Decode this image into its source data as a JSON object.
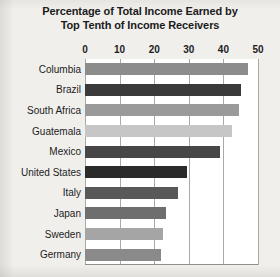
{
  "chart_data": {
    "type": "bar",
    "orientation": "horizontal",
    "title": "Percentage of Total Income Earned by Top Tenth of Income Receivers",
    "title_line1": "Percentage of Total Income Earned by",
    "title_line2": "Top Tenth of Income Receivers",
    "xlabel": "",
    "ylabel": "",
    "xlim": [
      0,
      50
    ],
    "xticks": [
      0,
      10,
      20,
      30,
      40,
      50
    ],
    "xtick_labels": [
      "0",
      "10",
      "20",
      "30",
      "40",
      "50"
    ],
    "grid": true,
    "grid_axis": "x",
    "legend": false,
    "categories": [
      "Columbia",
      "Brazil",
      "South Africa",
      "Guatemala",
      "Mexico",
      "United States",
      "Italy",
      "Japan",
      "Sweden",
      "Germany"
    ],
    "values": [
      47,
      45,
      44.5,
      42.5,
      39,
      29.5,
      27,
      23.5,
      22.5,
      22
    ],
    "bar_colors": [
      "#8c8c8c",
      "#3a3a3a",
      "#9a9a9a",
      "#c6c6c6",
      "#474747",
      "#2b2b2b",
      "#585858",
      "#6e6e6e",
      "#a5a5a5",
      "#8a8a8a"
    ],
    "bars": [
      {
        "label": "Columbia",
        "value": 47,
        "color": "#8c8c8c"
      },
      {
        "label": "Brazil",
        "value": 45,
        "color": "#3a3a3a"
      },
      {
        "label": "South Africa",
        "value": 44.5,
        "color": "#9a9a9a"
      },
      {
        "label": "Guatemala",
        "value": 42.5,
        "color": "#c6c6c6"
      },
      {
        "label": "Mexico",
        "value": 39,
        "color": "#474747"
      },
      {
        "label": "United States",
        "value": 29.5,
        "color": "#2b2b2b"
      },
      {
        "label": "Italy",
        "value": 27,
        "color": "#585858"
      },
      {
        "label": "Japan",
        "value": 23.5,
        "color": "#6e6e6e"
      },
      {
        "label": "Sweden",
        "value": 22.5,
        "color": "#a5a5a5"
      },
      {
        "label": "Germany",
        "value": 22,
        "color": "#8a8a8a"
      }
    ],
    "plot_background": "#ffffff",
    "page_background": "#f0efec",
    "gridline_color": "#a9a9a6",
    "text_color": "#1c1c1c"
  }
}
